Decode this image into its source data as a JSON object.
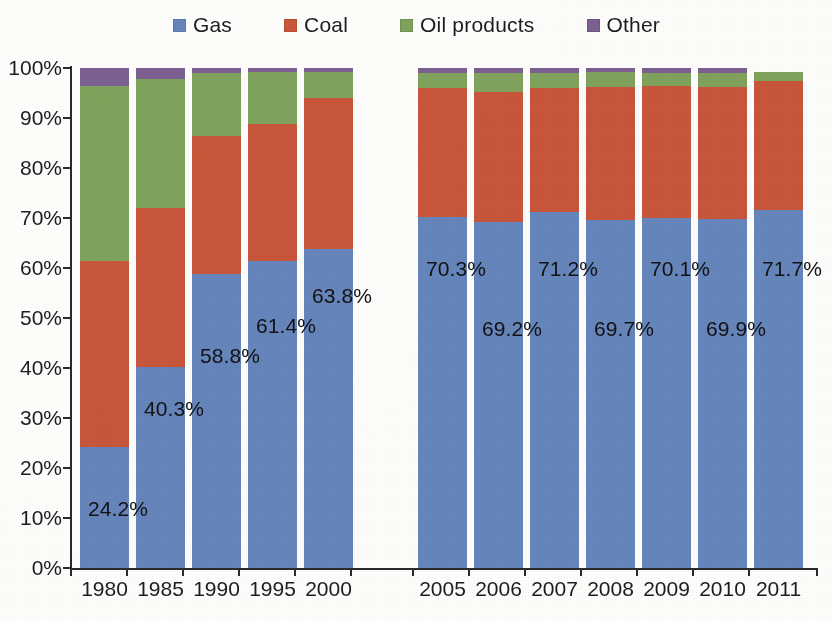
{
  "legend": {
    "position": "top-center",
    "items": [
      {
        "label": "Gas",
        "color": "#6585bb",
        "icon": "square-swatch-icon"
      },
      {
        "label": "Coal",
        "color": "#c8563a",
        "icon": "square-swatch-icon"
      },
      {
        "label": "Oil products",
        "color": "#7fa25c",
        "icon": "square-swatch-icon"
      },
      {
        "label": "Other",
        "color": "#7c6090",
        "icon": "square-swatch-icon"
      }
    ]
  },
  "axes": {
    "y_ticks": [
      "0%",
      "10%",
      "20%",
      "30%",
      "40%",
      "50%",
      "60%",
      "70%",
      "80%",
      "90%",
      "100%"
    ],
    "y_min": 0,
    "y_max": 100,
    "x_ticks": [
      "1980",
      "1985",
      "1990",
      "1995",
      "2000",
      "",
      "2005",
      "2006",
      "2007",
      "2008",
      "2009",
      "2010",
      "2011"
    ]
  },
  "chart_data": {
    "type": "bar",
    "subtype": "stacked-percent-column",
    "title": "",
    "subtitle": "",
    "xlabel": "",
    "ylabel": "",
    "ylim": [
      0,
      100
    ],
    "ytick_step": 10,
    "grid": false,
    "legend_position": "top-center",
    "gap_after_category": "2000",
    "categories": [
      "1980",
      "1985",
      "1990",
      "1995",
      "2000",
      "2005",
      "2006",
      "2007",
      "2008",
      "2009",
      "2010",
      "2011"
    ],
    "series": [
      {
        "name": "Gas",
        "color": "#6585bb",
        "values": [
          24.2,
          40.3,
          58.8,
          61.4,
          63.8,
          70.3,
          69.2,
          71.2,
          69.7,
          70.1,
          69.9,
          71.7
        ]
      },
      {
        "name": "Coal",
        "color": "#c8563a",
        "values": [
          37.3,
          31.7,
          27.7,
          27.5,
          30.2,
          25.8,
          26.1,
          24.9,
          26.5,
          26.3,
          26.3,
          25.7
        ]
      },
      {
        "name": "Oil products",
        "color": "#7fa25c",
        "values": [
          35.0,
          25.9,
          12.5,
          10.4,
          5.3,
          2.9,
          3.7,
          2.9,
          3.0,
          2.7,
          2.9,
          1.8
        ]
      },
      {
        "name": "Other",
        "color": "#7c6090",
        "values": [
          3.5,
          2.1,
          1.0,
          0.7,
          0.7,
          1.0,
          1.0,
          1.0,
          0.8,
          0.9,
          0.9,
          0.0
        ]
      }
    ],
    "data_labels": {
      "series": "Gas",
      "values": [
        "24.2%",
        "40.3%",
        "58.8%",
        "61.4%",
        "63.8%",
        "70.3%",
        "69.2%",
        "71.2%",
        "69.7%",
        "70.1%",
        "69.9%",
        "71.7%"
      ]
    }
  }
}
